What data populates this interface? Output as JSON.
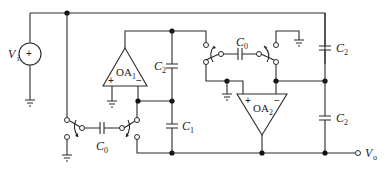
{
  "diagram": {
    "type": "switched-capacitor circuit",
    "source": {
      "label": "V",
      "sub": "i",
      "polarity": "+"
    },
    "output": {
      "label": "V",
      "sub": "o"
    },
    "opamps": [
      {
        "id": "OA1",
        "label": "OA",
        "sub": "1",
        "plus": "+",
        "minus": "−"
      },
      {
        "id": "OA2",
        "label": "OA",
        "sub": "2",
        "plus": "+",
        "minus": "−"
      }
    ],
    "capacitors": {
      "c0_top": {
        "label": "C",
        "sub": "0"
      },
      "c0_bottom": {
        "label": "C",
        "sub": "0"
      },
      "c1": {
        "label": "C",
        "sub": "1"
      },
      "c2_oa1": {
        "label": "C",
        "sub": "2"
      },
      "c2_right_top": {
        "label": "C",
        "sub": "2"
      },
      "c2_right_bottom": {
        "label": "C",
        "sub": "2"
      }
    },
    "colors": {
      "wire": "#2a2a2a",
      "background": "#ffffff"
    }
  }
}
